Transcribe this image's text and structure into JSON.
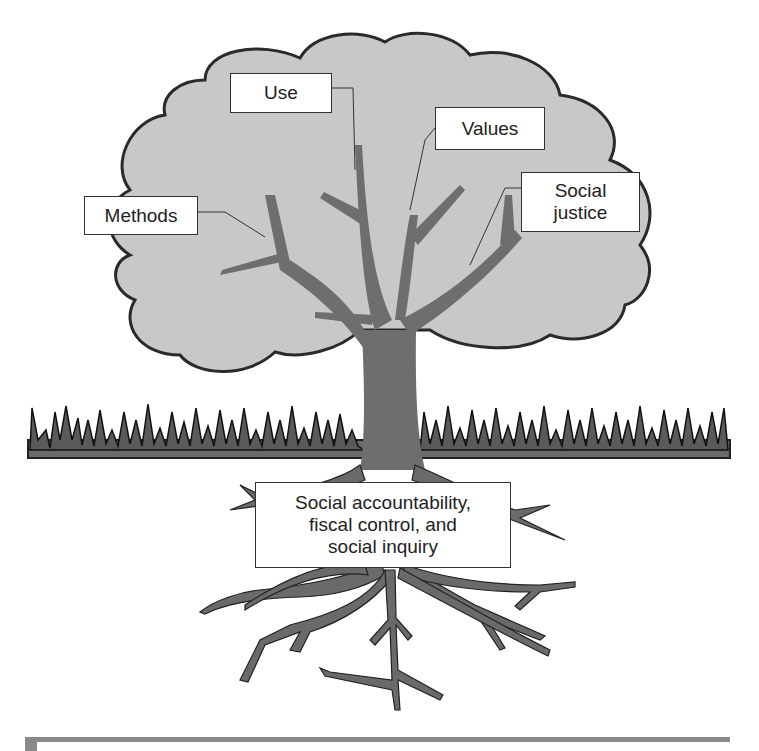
{
  "diagram": {
    "title": "",
    "labels": {
      "use": "Use",
      "values": "Values",
      "social_justice_line1": "Social",
      "social_justice_line2": "justice",
      "methods": "Methods",
      "roots_line1": "Social accountability,",
      "roots_line2": "fiscal control, and",
      "roots_line3": "social inquiry"
    },
    "colors": {
      "crown_fill": "#c8c8c8",
      "crown_stroke": "#2a2a2a",
      "trunk": "#6e6e6e",
      "grass": "#555555",
      "roots": "#6a6a6a",
      "bottom_bar": "#8a8a8a"
    }
  }
}
